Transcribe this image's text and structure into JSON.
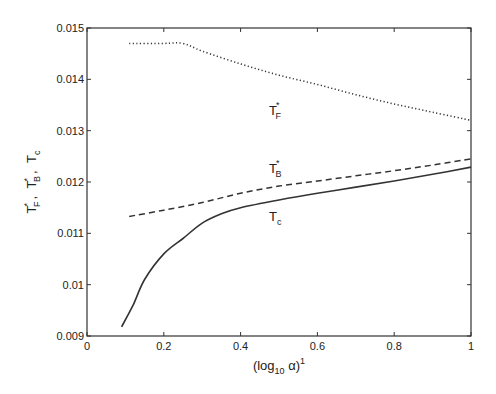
{
  "chart_data": {
    "type": "line",
    "title": "",
    "xlabel": "(log10 α)^1",
    "xlabel_parts": {
      "pre": "(log",
      "sub": "10",
      "mid": " α)",
      "sup": "1"
    },
    "ylabel": "T*_F , T*_B , T_c",
    "xlim": [
      0,
      1
    ],
    "ylim": [
      0.009,
      0.015
    ],
    "grid": false,
    "legend": "none (inline annotations)",
    "x_ticks": [
      0,
      0.2,
      0.4,
      0.6,
      0.8,
      1
    ],
    "x_tick_labels": [
      "0",
      "0.2",
      "0.4",
      "0.6",
      "0.8",
      "1"
    ],
    "y_ticks": [
      0.009,
      0.01,
      0.011,
      0.012,
      0.013,
      0.014,
      0.015
    ],
    "y_tick_labels": [
      "0.009",
      "0.01",
      "0.011",
      "0.012",
      "0.013",
      "0.014",
      "0.015"
    ],
    "series": [
      {
        "name": "T*_F",
        "style": "dotted",
        "x": [
          0.11,
          0.2,
          0.25,
          0.3,
          0.4,
          0.5,
          0.6,
          0.7,
          0.8,
          0.9,
          1.0
        ],
        "values": [
          0.0147,
          0.0147,
          0.0147,
          0.01455,
          0.0143,
          0.01408,
          0.0139,
          0.0137,
          0.01352,
          0.01336,
          0.0132
        ]
      },
      {
        "name": "T*_B",
        "style": "dashed",
        "x": [
          0.11,
          0.2,
          0.3,
          0.4,
          0.5,
          0.6,
          0.7,
          0.8,
          0.9,
          1.0
        ],
        "values": [
          0.01133,
          0.01145,
          0.0116,
          0.01178,
          0.01192,
          0.01202,
          0.01212,
          0.01222,
          0.01233,
          0.01245
        ]
      },
      {
        "name": "T_c",
        "style": "solid",
        "x": [
          0.09,
          0.12,
          0.15,
          0.2,
          0.25,
          0.3,
          0.35,
          0.4,
          0.5,
          0.6,
          0.7,
          0.8,
          0.9,
          1.0
        ],
        "values": [
          0.00918,
          0.0096,
          0.0101,
          0.0106,
          0.0109,
          0.0112,
          0.01138,
          0.0115,
          0.01165,
          0.01178,
          0.0119,
          0.01202,
          0.01215,
          0.01229
        ]
      }
    ],
    "annotations": [
      {
        "text": "T*_F",
        "base": "T",
        "sub": "F",
        "sup": "*",
        "x": 0.5,
        "y": 0.0133
      },
      {
        "text": "T*_B",
        "base": "T",
        "sub": "B",
        "sup": "*",
        "x": 0.5,
        "y": 0.01218
      },
      {
        "text": "T_c",
        "base": "T",
        "sub": "c",
        "sup": "",
        "x": 0.5,
        "y": 0.01125
      }
    ]
  },
  "colors": {
    "axis": "#333333",
    "line": "#333333"
  },
  "ylabel_parts": [
    {
      "base": "T",
      "sup": "*",
      "sub": "F"
    },
    {
      "base": "T",
      "sup": "*",
      "sub": "B"
    },
    {
      "base": "T",
      "sup": "",
      "sub": "c"
    }
  ]
}
